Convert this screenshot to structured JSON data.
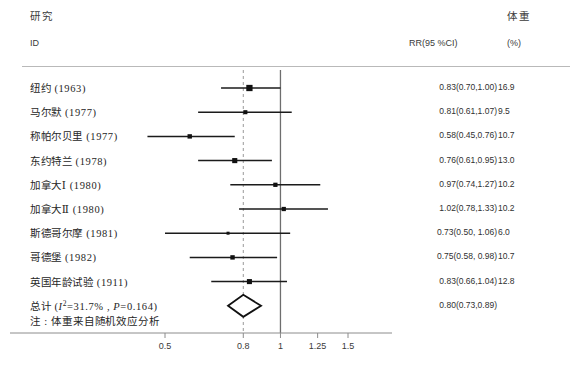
{
  "header": {
    "study_cn": "研究",
    "study_id": "ID",
    "rr_label": "RR(95 %CI)",
    "weight_cn": "体重",
    "weight_unit": "(%)"
  },
  "note": "注 : 体重来自随机效应分析",
  "axis": {
    "ticks": [
      "0.5",
      "0.8",
      "1",
      "1.25",
      "1.5"
    ],
    "tick_values": [
      0.5,
      0.8,
      1,
      1.25,
      1.5
    ],
    "reference_line": 1,
    "pooled_line": 0.8
  },
  "chart_data": {
    "type": "forest",
    "title": "",
    "xlabel": "",
    "ylabel": "",
    "xscale": "log",
    "xlim": [
      0.4,
      1.75
    ],
    "grid": false,
    "legend": "none",
    "columns": [
      "研究 ID",
      "RR(95 %CI)",
      "体重 (%)"
    ],
    "reference_line": 1.0,
    "summary_line": 0.8,
    "categories": [
      "纽约 (1963)",
      "马尔默 (1977)",
      "称帕尔贝里 (1977)",
      "东约特兰 (1978)",
      "加拿大Ⅰ (1980)",
      "加拿大Ⅱ (1980)",
      "斯德哥尔摩 (1981)",
      "哥德堡 (1982)",
      "英国年龄试验 (1911)"
    ],
    "values": [
      0.83,
      0.81,
      0.58,
      0.76,
      0.97,
      1.02,
      0.73,
      0.75,
      0.83
    ],
    "ci_low": [
      0.7,
      0.61,
      0.45,
      0.61,
      0.74,
      0.78,
      0.5,
      0.58,
      0.66
    ],
    "ci_high": [
      1.0,
      1.07,
      0.76,
      0.95,
      1.27,
      1.33,
      1.06,
      0.98,
      1.04
    ],
    "weights": [
      16.9,
      9.5,
      10.7,
      13.0,
      10.2,
      10.2,
      6.0,
      10.7,
      12.8
    ],
    "summary": {
      "label": "总计 (I²=31.7% , P=0.164)",
      "value": 0.8,
      "ci_low": 0.73,
      "ci_high": 0.89,
      "heterogeneity_i2": "31.7%",
      "heterogeneity_p": "0.164"
    }
  },
  "rows": [
    {
      "label": "纽约 (1963)",
      "rr": "0.83(0.70,1.00)",
      "wt": "16.9"
    },
    {
      "label": "马尔默 (1977)",
      "rr": "0.81(0.61,1.07)",
      "wt": "9.5"
    },
    {
      "label": "称帕尔贝里 (1977)",
      "rr": "0.58(0.45,0.76)",
      "wt": "10.7"
    },
    {
      "label": "东约特兰 (1978)",
      "rr": "0.76(0.61,0.95)",
      "wt": "13.0"
    },
    {
      "label": "加拿大Ⅰ (1980)",
      "rr": "0.97(0.74,1.27)",
      "wt": "10.2"
    },
    {
      "label": "加拿大Ⅱ (1980)",
      "rr": "1.02(0.78,1.33)",
      "wt": "10.2"
    },
    {
      "label": "斯德哥尔摩 (1981)",
      "rr": "0.73(0.50, 1.06)",
      "wt": "6.0"
    },
    {
      "label": "哥德堡 (1982)",
      "rr": "0.75(0.58, 0.98)",
      "wt": "10.7"
    },
    {
      "label": "英国年龄试验 (1911)",
      "rr": "0.83(0.66,1.04)",
      "wt": "12.8"
    },
    {
      "label": "总计 (I²=31.7% , P=0.164)",
      "rr": "0.80(0.73,0.89)",
      "wt": ""
    }
  ]
}
